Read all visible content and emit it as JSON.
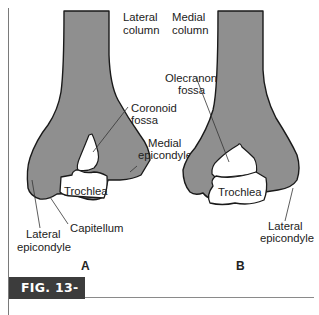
{
  "figure": {
    "caption": "FIG. 13-3",
    "colors": {
      "bone_fill": "#8f8f8f",
      "outline": "#1a1a1a",
      "caption_bg": "#3c3c3c",
      "caption_text": "#ffffff",
      "text": "#222222"
    }
  },
  "panel_a": {
    "letter": "A",
    "labels": {
      "lateral_column_1": "Lateral",
      "lateral_column_2": "column",
      "coronoid_fossa_1": "Coronoid",
      "coronoid_fossa_2": "fossa",
      "medial_epicondyle_1": "Medial",
      "medial_epicondyle_2": "epicondyle",
      "trochlea": "Trochlea",
      "capitellum": "Capitellum",
      "lateral_epicondyle_1": "Lateral",
      "lateral_epicondyle_2": "epicondyle"
    }
  },
  "panel_b": {
    "letter": "B",
    "labels": {
      "medial_column_1": "Medial",
      "medial_column_2": "column",
      "olecranon_fossa_1": "Olecranon",
      "olecranon_fossa_2": "fossa",
      "trochlea": "Trochlea",
      "lateral_epicondyle_1": "Lateral",
      "lateral_epicondyle_2": "epicondyle"
    }
  }
}
